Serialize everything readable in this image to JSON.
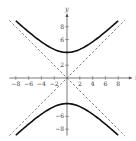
{
  "cropped_header": "",
  "chart_data": {
    "type": "line",
    "title": "",
    "xlabel": "x",
    "ylabel": "y",
    "xlim": [
      -9,
      9.5
    ],
    "ylim": [
      -9,
      10
    ],
    "grid": false,
    "legend": "none",
    "x_ticks": [
      -8,
      -6,
      -4,
      -2,
      2,
      4,
      6,
      8
    ],
    "x_tick_labels": [
      "−8",
      "−6",
      "−4",
      "−2",
      "2",
      "4",
      "6",
      "8"
    ],
    "y_ticks": [
      8,
      6,
      2,
      -6,
      -8
    ],
    "y_tick_labels": [
      "8",
      "6",
      "2",
      "−6",
      "−8"
    ],
    "series": [
      {
        "name": "hyperbola upper branch",
        "equation": "y = sqrt(16 + x^2)",
        "style": "solid",
        "color": "#111111",
        "x_range": [
          -8,
          8
        ]
      },
      {
        "name": "hyperbola lower branch",
        "equation": "y = -sqrt(16 + x^2)",
        "style": "solid",
        "color": "#111111",
        "x_range": [
          -8,
          8
        ]
      },
      {
        "name": "asymptote",
        "equation": "y = x",
        "style": "dashed",
        "color": "#555555",
        "x_range": [
          -9,
          9
        ]
      },
      {
        "name": "asymptote",
        "equation": "y = -x",
        "style": "dashed",
        "color": "#555555",
        "x_range": [
          -9,
          9
        ]
      }
    ],
    "vertices": [
      [
        0,
        4
      ],
      [
        0,
        -4
      ]
    ]
  }
}
